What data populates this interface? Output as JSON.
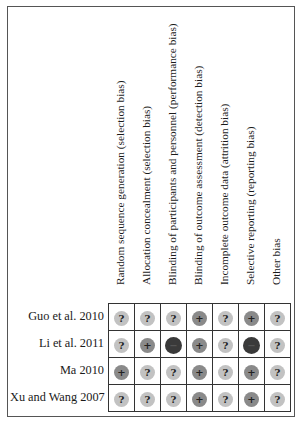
{
  "chart_data": {
    "type": "table",
    "columns": [
      "Random sequence generation (selection bias)",
      "Allocation concealment (selection bias)",
      "Blinding of participants and personnel (performance bias)",
      "Blinding of outcome assessment (detection bias)",
      "Incomplete outcome data (attrition bias)",
      "Selective reporting (reporting bias)",
      "Other bias"
    ],
    "rows": [
      {
        "study": "Guo et al. 2010",
        "values": [
          "?",
          "?",
          "?",
          "+",
          "?",
          "+",
          "?"
        ]
      },
      {
        "study": "Li et al. 2011",
        "values": [
          "?",
          "+",
          "-",
          "+",
          "?",
          "-",
          "?"
        ]
      },
      {
        "study": "Ma 2010",
        "values": [
          "+",
          "?",
          "?",
          "+",
          "?",
          "+",
          "?"
        ]
      },
      {
        "study": "Xu and Wang 2007",
        "values": [
          "?",
          "?",
          "?",
          "+",
          "?",
          "+",
          "?"
        ]
      }
    ],
    "legend": {
      "+": "low risk of bias",
      "?": "unclear risk of bias",
      "-": "high risk of bias"
    },
    "colors": {
      "low": "#8a8a8a",
      "unclear": "#c2c2c2",
      "high": "#3a3a3a"
    }
  },
  "symbols": {
    "low": "+",
    "unclear": "?",
    "high": "−"
  }
}
